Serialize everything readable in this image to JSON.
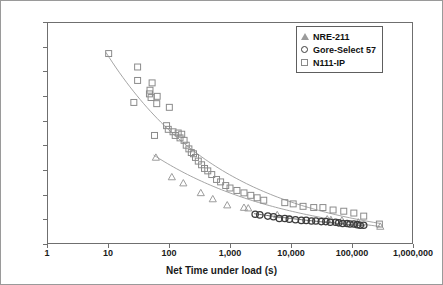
{
  "chart_data": {
    "type": "scatter",
    "title": "",
    "xlabel": "Net Time under load (s)",
    "ylabel": "Stress at Leak (MPa)",
    "xscale": "log",
    "xlim": [
      1,
      1000000
    ],
    "ylim": [
      0,
      18
    ],
    "grid": false,
    "legend_position": "top-right",
    "xticks": [
      1,
      10,
      100,
      1000,
      10000,
      100000,
      1000000
    ],
    "xtick_labels": [
      "1",
      "10",
      "100",
      "1,000",
      "10,000",
      "100,000",
      "1,000,000"
    ],
    "yticks": [
      0,
      2,
      4,
      6,
      8,
      10,
      12,
      14,
      16,
      18
    ],
    "ytick_labels": [
      "0",
      "2",
      "4",
      "6",
      "8",
      "10",
      "12",
      "14",
      "16",
      "18"
    ],
    "series": [
      {
        "name": "NRE-211",
        "marker": "triangle",
        "color": "#9b9b9b",
        "points": [
          [
            60,
            7.0
          ],
          [
            110,
            5.4
          ],
          [
            170,
            4.9
          ],
          [
            330,
            4.1
          ],
          [
            520,
            3.6
          ],
          [
            900,
            3.1
          ],
          [
            1700,
            2.9
          ],
          [
            2000,
            2.85
          ],
          [
            6000,
            2.3
          ],
          [
            40000,
            1.95
          ],
          [
            46000,
            1.9
          ],
          [
            70000,
            1.85
          ],
          [
            130000,
            1.7
          ],
          [
            300000,
            1.35
          ]
        ],
        "trend": [
          [
            55,
            7.2
          ],
          [
            300000,
            1.35
          ]
        ]
      },
      {
        "name": "Gore-Select 57",
        "marker": "circle",
        "color": "#3c3c3c",
        "points": [
          [
            2600,
            2.35
          ],
          [
            3100,
            2.3
          ],
          [
            4200,
            2.2
          ],
          [
            5200,
            2.15
          ],
          [
            6500,
            2.0
          ],
          [
            8000,
            2.0
          ],
          [
            9500,
            1.95
          ],
          [
            12000,
            1.9
          ],
          [
            15000,
            1.85
          ],
          [
            18000,
            1.85
          ],
          [
            22000,
            1.8
          ],
          [
            26000,
            1.8
          ],
          [
            32000,
            1.75
          ],
          [
            38000,
            1.75
          ],
          [
            45000,
            1.7
          ],
          [
            55000,
            1.7
          ],
          [
            62000,
            1.65
          ],
          [
            72000,
            1.6
          ],
          [
            85000,
            1.6
          ],
          [
            95000,
            1.55
          ],
          [
            110000,
            1.55
          ],
          [
            125000,
            1.5
          ],
          [
            140000,
            1.45
          ],
          [
            160000,
            1.45
          ]
        ],
        "trend": [
          [
            2500,
            2.4
          ],
          [
            170000,
            1.4
          ]
        ]
      },
      {
        "name": "N111-IP",
        "marker": "square",
        "color": "#8a8a8a",
        "points": [
          [
            10,
            15.5
          ],
          [
            30,
            14.4
          ],
          [
            30,
            13.3
          ],
          [
            26,
            11.5
          ],
          [
            52,
            13.1
          ],
          [
            48,
            12.5
          ],
          [
            47,
            12.2
          ],
          [
            50,
            11.9
          ],
          [
            62,
            11.4
          ],
          [
            63,
            12.0
          ],
          [
            57,
            8.8
          ],
          [
            100,
            11.1
          ],
          [
            90,
            9.6
          ],
          [
            96,
            9.3
          ],
          [
            115,
            9.1
          ],
          [
            125,
            8.8
          ],
          [
            140,
            9.0
          ],
          [
            150,
            8.6
          ],
          [
            160,
            8.9
          ],
          [
            175,
            8.4
          ],
          [
            190,
            8.0
          ],
          [
            210,
            7.7
          ],
          [
            230,
            7.4
          ],
          [
            250,
            7.3
          ],
          [
            270,
            7.0
          ],
          [
            300,
            6.7
          ],
          [
            340,
            6.4
          ],
          [
            380,
            6.1
          ],
          [
            430,
            5.9
          ],
          [
            500,
            5.6
          ],
          [
            600,
            5.2
          ],
          [
            700,
            5.0
          ],
          [
            850,
            4.7
          ],
          [
            1000,
            4.5
          ],
          [
            1300,
            4.3
          ],
          [
            1700,
            4.1
          ],
          [
            2200,
            3.9
          ],
          [
            2800,
            3.7
          ],
          [
            3600,
            3.5
          ],
          [
            8000,
            3.3
          ],
          [
            11000,
            3.2
          ],
          [
            16000,
            3.0
          ],
          [
            24000,
            2.9
          ],
          [
            34000,
            2.9
          ],
          [
            50000,
            2.7
          ],
          [
            75000,
            2.6
          ],
          [
            110000,
            2.45
          ],
          [
            160000,
            2.2
          ],
          [
            290000,
            1.55
          ]
        ],
        "trend": [
          [
            9,
            15.6
          ],
          [
            300000,
            1.6
          ]
        ]
      }
    ]
  },
  "legend": {
    "items": [
      {
        "label": "NRE-211",
        "marker": "triangle"
      },
      {
        "label": "Gore-Select 57",
        "marker": "circle"
      },
      {
        "label": "N111-IP",
        "marker": "square"
      }
    ]
  },
  "axes": {
    "y_title": "Stress at Leak (MPa)",
    "x_title": "Net Time under load (s)"
  }
}
